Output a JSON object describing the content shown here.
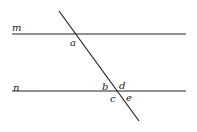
{
  "diagram": {
    "type": "parallel-lines-transversal",
    "line_color": "#222222",
    "lines": [
      {
        "name": "m",
        "label": "m",
        "x1": 12,
        "y1": 34,
        "x2": 186,
        "y2": 34
      },
      {
        "name": "n",
        "label": "n",
        "x1": 12,
        "y1": 91,
        "x2": 186,
        "y2": 91
      },
      {
        "name": "transversal",
        "label": "",
        "x1": 59,
        "y1": 11,
        "x2": 139,
        "y2": 121
      }
    ],
    "line_labels": [
      {
        "text": "m",
        "x": 12,
        "y": 31
      },
      {
        "text": "n",
        "x": 13,
        "y": 91
      }
    ],
    "angle_labels": [
      {
        "text": "a",
        "x": 70,
        "y": 46
      },
      {
        "text": "b",
        "x": 102,
        "y": 90
      },
      {
        "text": "d",
        "x": 119,
        "y": 89
      },
      {
        "text": "c",
        "x": 110,
        "y": 102
      },
      {
        "text": "e",
        "x": 126,
        "y": 101
      }
    ]
  }
}
